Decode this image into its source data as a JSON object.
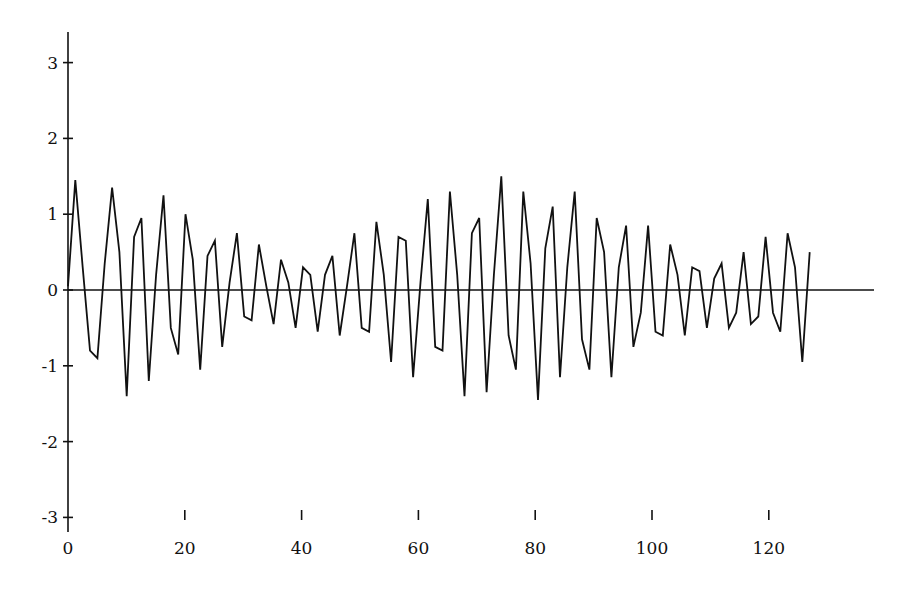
{
  "chart_data": {
    "type": "line",
    "title": "",
    "xlabel": "",
    "ylabel": "",
    "xlim": [
      0,
      138
    ],
    "ylim": [
      -3,
      3.4
    ],
    "grid": false,
    "legend": null,
    "x_ticks": [
      0,
      20,
      40,
      60,
      80,
      100,
      120
    ],
    "x_tick_labels": [
      "0",
      "20",
      "40",
      "60",
      "80",
      "100",
      "120"
    ],
    "y_ticks": [
      3,
      2,
      1,
      0,
      -1,
      -2,
      -3
    ],
    "y_tick_labels": [
      "3",
      "2",
      "1",
      "0",
      "-1",
      "-2",
      "-3"
    ],
    "baseline": 0,
    "series": [
      {
        "name": "signal",
        "color": "#111111",
        "x_start": 0,
        "x_step": 1,
        "values": [
          0.05,
          1.45,
          0.3,
          -0.8,
          -0.9,
          0.35,
          1.35,
          0.5,
          -1.4,
          0.7,
          0.95,
          -1.2,
          0.2,
          1.25,
          -0.5,
          -0.85,
          1.0,
          0.4,
          -1.05,
          0.45,
          0.65,
          -0.75,
          0.1,
          0.75,
          -0.35,
          -0.4,
          0.6,
          0.05,
          -0.45,
          0.4,
          0.1,
          -0.5,
          0.3,
          0.2,
          -0.55,
          0.2,
          0.45,
          -0.6,
          0.05,
          0.75,
          -0.5,
          -0.55,
          0.9,
          0.2,
          -0.95,
          0.7,
          0.65,
          -1.15,
          0.1,
          1.2,
          -0.75,
          -0.8,
          1.3,
          0.2,
          -1.4,
          0.75,
          0.95,
          -1.35,
          0.2,
          1.5,
          -0.6,
          -1.05,
          1.3,
          0.35,
          -1.45,
          0.55,
          1.1,
          -1.15,
          0.3,
          1.3,
          -0.65,
          -1.05,
          0.95,
          0.5,
          -1.15,
          0.3,
          0.85,
          -0.75,
          -0.3,
          0.85,
          -0.55,
          -0.6,
          0.6,
          0.2,
          -0.6,
          0.3,
          0.25,
          -0.5,
          0.15,
          0.35,
          -0.5,
          -0.3,
          0.5,
          -0.45,
          -0.35,
          0.7,
          -0.3,
          -0.55,
          0.75,
          0.3,
          -0.95,
          0.5
        ]
      }
    ]
  }
}
